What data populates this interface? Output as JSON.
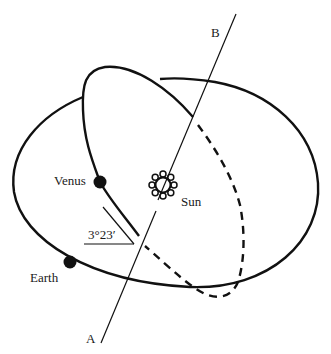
{
  "diagram": {
    "type": "orbital-inclination",
    "labels": {
      "venus": "Venus",
      "earth": "Earth",
      "sun": "Sun",
      "axis_top": "B",
      "axis_bottom": "A",
      "angle": "3°23′"
    },
    "elements": {
      "ecliptic_plane": "Earth's orbit (large ellipse)",
      "venus_orbit": "Venus's inclined orbit (solid front, dashed behind)",
      "line_of_nodes": "Line A–B through the Sun",
      "angle_marker": "Inclination angle between orbits"
    },
    "colors": {
      "stroke": "#111111",
      "background": "#ffffff"
    }
  }
}
